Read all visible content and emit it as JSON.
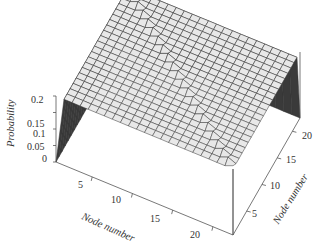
{
  "chart_data": {
    "type": "surface3d",
    "title": "",
    "xlabel": "Node number",
    "ylabel": "Node number",
    "zlabel": "Probability",
    "x_ticks": [
      "5",
      "10",
      "15",
      "20"
    ],
    "y_ticks": [
      "5",
      "10",
      "15",
      "20"
    ],
    "z_ticks": [
      "0",
      "0.05",
      "0.1",
      "0.15",
      "0.2"
    ],
    "x_range": [
      1,
      22
    ],
    "y_range": [
      1,
      22
    ],
    "zlim": [
      0,
      0.2
    ],
    "grid_size": 22,
    "baseline_probability": 0.2,
    "ridge": {
      "orientation": "diagonal across grid",
      "height": 0.21
    },
    "edge_drops": [
      {
        "edge": "x=1",
        "value": 0
      },
      {
        "edge": "y=22",
        "value": 0
      }
    ],
    "surface_color": "#e8e8e8",
    "mesh_color": "#333333",
    "shadow_color": "#3a3a3a"
  },
  "axes": {
    "z_label": "Probability",
    "z_ticks": [
      "0.2",
      "0.15",
      "0.1",
      "0.05",
      "0"
    ],
    "x_label": "Node number",
    "x_ticks": [
      "5",
      "10",
      "15",
      "20"
    ],
    "y_label": "Node number",
    "y_ticks": [
      "5",
      "10",
      "15",
      "20"
    ]
  }
}
